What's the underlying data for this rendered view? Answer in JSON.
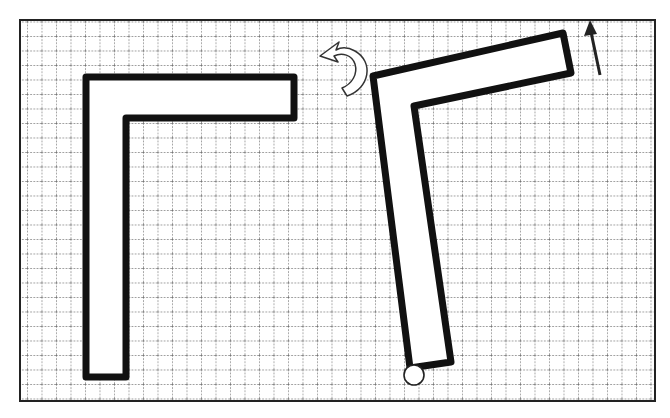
{
  "diagram": {
    "colors": {
      "background": "#ffffff",
      "frame": "#222222",
      "grid": "#555555",
      "shape_fill": "#ffffff",
      "shape_stroke": "#111111",
      "arrow": "#222222"
    },
    "frame": {
      "x": 20,
      "y": 20,
      "width": 635,
      "height": 381
    },
    "grid": {
      "origin_x": 27,
      "origin_y": 21.5,
      "spacing": 14.5
    },
    "shapes": [
      {
        "name": "original-l-shape",
        "points": "86,77 294,77 294,118 126,118 126,377 86,377"
      },
      {
        "name": "rotated-l-shape",
        "points": "373,76 563,33 571,73 414,106 451,362 410,368"
      }
    ],
    "pivot": {
      "cx": 414,
      "cy": 375,
      "r": 10
    },
    "rotation_arrow": {
      "direction": "counterclockwise"
    },
    "direction_arrow": {
      "x1": 600,
      "y1": 75,
      "x2": 591,
      "y2": 22
    }
  }
}
